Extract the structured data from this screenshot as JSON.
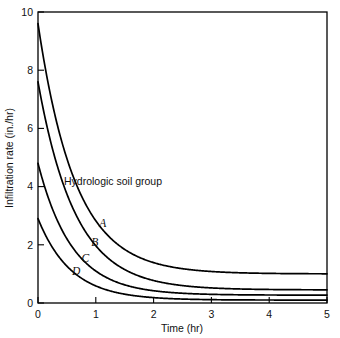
{
  "chart_data": {
    "type": "line",
    "title": "",
    "xlabel": "Time (hr)",
    "ylabel": "Infiltration rate (in./hr)",
    "xlim": [
      0,
      5
    ],
    "ylim": [
      0,
      10
    ],
    "xticks": [
      "0",
      "1",
      "2",
      "3",
      "4",
      "5"
    ],
    "yticks": [
      "0",
      "2",
      "4",
      "6",
      "8",
      "10"
    ],
    "grid": false,
    "legend_position": "inline-curve-labels",
    "annotations": [
      {
        "text": "Hydrologic soil group",
        "x": 0.45,
        "y": 4.05
      }
    ],
    "series": [
      {
        "name": "A",
        "label": "A",
        "label_x": 1.12,
        "label_y": 2.62,
        "initial_rate": 9.6,
        "final_rate": 1.0,
        "decay_k": 1.55,
        "x": [
          0,
          0.25,
          0.5,
          0.75,
          1.0,
          1.25,
          1.5,
          1.75,
          2.0,
          2.5,
          3.0,
          3.5,
          4.0,
          4.5,
          5.0
        ],
        "y": [
          9.6,
          6.83,
          4.96,
          3.69,
          2.83,
          2.24,
          1.85,
          1.58,
          1.39,
          1.17,
          1.07,
          1.03,
          1.01,
          1.0,
          1.0
        ]
      },
      {
        "name": "B",
        "label": "B",
        "label_x": 0.98,
        "label_y": 1.95,
        "initial_rate": 7.6,
        "final_rate": 0.45,
        "decay_k": 1.55,
        "x": [
          0,
          0.25,
          0.5,
          0.75,
          1.0,
          1.25,
          1.5,
          1.75,
          2.0,
          2.5,
          3.0,
          3.5,
          4.0,
          4.5,
          5.0
        ],
        "y": [
          7.6,
          5.3,
          3.74,
          2.69,
          1.97,
          1.48,
          1.15,
          0.93,
          0.77,
          0.59,
          0.51,
          0.47,
          0.46,
          0.45,
          0.45
        ]
      },
      {
        "name": "C",
        "label": "C",
        "label_x": 0.82,
        "label_y": 1.42,
        "initial_rate": 4.8,
        "final_rate": 0.27,
        "decay_k": 1.7,
        "x": [
          0,
          0.25,
          0.5,
          0.75,
          1.0,
          1.25,
          1.5,
          1.75,
          2.0,
          2.5,
          3.0,
          3.5,
          4.0,
          4.5,
          5.0
        ],
        "y": [
          4.8,
          3.23,
          2.2,
          1.53,
          1.09,
          0.8,
          0.61,
          0.48,
          0.4,
          0.31,
          0.28,
          0.27,
          0.27,
          0.27,
          0.27
        ]
      },
      {
        "name": "D",
        "label": "D",
        "label_x": 0.66,
        "label_y": 0.95,
        "initial_rate": 2.9,
        "final_rate": 0.1,
        "decay_k": 1.75,
        "x": [
          0,
          0.25,
          0.5,
          0.75,
          1.0,
          1.25,
          1.5,
          1.75,
          2.0,
          2.5,
          3.0,
          3.5,
          4.0,
          4.5,
          5.0
        ],
        "y": [
          2.9,
          1.91,
          1.27,
          0.86,
          0.59,
          0.42,
          0.31,
          0.23,
          0.18,
          0.13,
          0.11,
          0.1,
          0.1,
          0.1,
          0.1
        ]
      }
    ]
  }
}
